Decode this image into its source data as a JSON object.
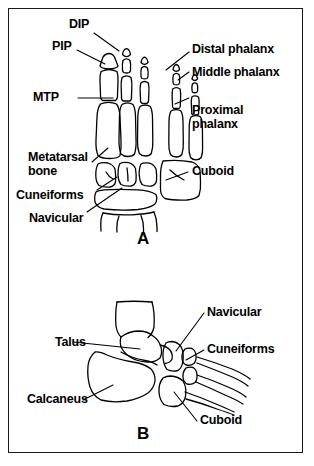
{
  "figure": {
    "background_color": "#ffffff",
    "ink_color": "#000000",
    "frame_color": "#1a1a1a",
    "panels": [
      {
        "letter": "A",
        "view": "dorsal-foot-skeleton",
        "labels": [
          {
            "key": "dip",
            "text": "DIP"
          },
          {
            "key": "pip",
            "text": "PIP"
          },
          {
            "key": "mtp",
            "text": "MTP"
          },
          {
            "key": "metatarsal_bone_1",
            "text": "Metatarsal"
          },
          {
            "key": "metatarsal_bone_2",
            "text": "bone"
          },
          {
            "key": "cuneiforms",
            "text": "Cuneiforms"
          },
          {
            "key": "navicular",
            "text": "Navicular"
          },
          {
            "key": "distal_phalanx",
            "text": "Distal phalanx"
          },
          {
            "key": "middle_phalanx",
            "text": "Middle phalanx"
          },
          {
            "key": "proximal_phalanx_1",
            "text": "Proximal"
          },
          {
            "key": "proximal_phalanx_2",
            "text": "phalanx"
          },
          {
            "key": "cuboid",
            "text": "Cuboid"
          }
        ]
      },
      {
        "letter": "B",
        "view": "lateral-foot-skeleton",
        "labels": [
          {
            "key": "talus",
            "text": "Talus"
          },
          {
            "key": "calcaneus",
            "text": "Calcaneus"
          },
          {
            "key": "navicular",
            "text": "Navicular"
          },
          {
            "key": "cuneiforms",
            "text": "Cuneiforms"
          },
          {
            "key": "cuboid",
            "text": "Cuboid"
          }
        ]
      }
    ]
  }
}
